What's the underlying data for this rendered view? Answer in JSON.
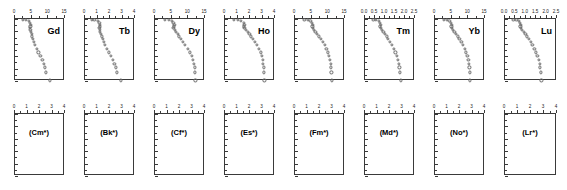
{
  "figure": {
    "type": "multi-panel-depth-profile-grid",
    "rows": 2,
    "columns": 8,
    "marker_style": "open-circle",
    "marker_color": "#6a6a6a",
    "axis_color": "#3a3a3a",
    "background": "#ffffff",
    "y_axis": {
      "label_values": [
        "0",
        "1",
        "2",
        "3",
        "4",
        "5"
      ],
      "min": 0,
      "max": 5,
      "direction": "increasing-downward"
    }
  },
  "chart_data": {
    "type": "scatter",
    "title": "",
    "xlabel": "",
    "ylabel": "",
    "shared_ylim": [
      0,
      5
    ],
    "shared_yticks": [
      0,
      1,
      2,
      3,
      4,
      5
    ],
    "grid": false,
    "legend": "none",
    "panels": [
      {
        "row": "top",
        "index": 0,
        "label": "Gd",
        "xlim": [
          0,
          15
        ],
        "xticks": [
          0,
          5,
          10,
          15
        ],
        "xticklabels": [
          "0",
          "5",
          "10",
          "15"
        ],
        "x": [
          2.4,
          3.2,
          4.1,
          4.5,
          4.7,
          4.6,
          4.5,
          4.6,
          4.8,
          5.0,
          5.1,
          5.3,
          5.6,
          6.0,
          6.5,
          7.0,
          7.6,
          8.2,
          8.6,
          9.0,
          9.2,
          10.5
        ],
        "y": [
          0.05,
          0.1,
          0.15,
          0.3,
          0.45,
          0.6,
          0.75,
          0.9,
          1.05,
          1.2,
          1.4,
          1.6,
          1.85,
          2.1,
          2.4,
          2.7,
          3.0,
          3.3,
          3.6,
          3.9,
          4.3,
          4.95
        ]
      },
      {
        "row": "top",
        "index": 1,
        "label": "Tb",
        "xlim": [
          0,
          4
        ],
        "xticks": [
          0,
          1,
          2,
          3,
          4
        ],
        "xticklabels": [
          "0",
          "1",
          "2",
          "3",
          "4"
        ],
        "x": [
          0.55,
          0.75,
          1.0,
          1.15,
          1.2,
          1.18,
          1.15,
          1.18,
          1.22,
          1.28,
          1.33,
          1.4,
          1.5,
          1.6,
          1.75,
          1.9,
          2.05,
          2.2,
          2.35,
          2.45,
          2.55,
          2.9
        ],
        "y": [
          0.05,
          0.1,
          0.15,
          0.3,
          0.45,
          0.6,
          0.75,
          0.9,
          1.05,
          1.2,
          1.4,
          1.6,
          1.85,
          2.1,
          2.4,
          2.7,
          3.0,
          3.3,
          3.6,
          3.9,
          4.3,
          4.95
        ]
      },
      {
        "row": "top",
        "index": 2,
        "label": "Dy",
        "xlim": [
          0,
          15
        ],
        "xticks": [
          0,
          5,
          10,
          15
        ],
        "xticklabels": [
          "0",
          "5",
          "10",
          "15"
        ],
        "x": [
          3.0,
          4.2,
          5.0,
          5.5,
          5.8,
          5.6,
          5.5,
          5.9,
          6.3,
          6.8,
          7.2,
          7.7,
          8.4,
          9.0,
          9.8,
          10.4,
          11.0,
          11.4,
          11.7,
          11.9,
          12.0,
          12.1
        ],
        "y": [
          0.05,
          0.1,
          0.15,
          0.3,
          0.45,
          0.6,
          0.75,
          0.9,
          1.05,
          1.2,
          1.4,
          1.6,
          1.85,
          2.1,
          2.4,
          2.7,
          3.0,
          3.3,
          3.6,
          3.9,
          4.3,
          4.95
        ]
      },
      {
        "row": "top",
        "index": 3,
        "label": "Ho",
        "xlim": [
          0,
          4
        ],
        "xticks": [
          0,
          1,
          2,
          3,
          4
        ],
        "xticklabels": [
          "0",
          "1",
          "2",
          "3",
          "4"
        ],
        "x": [
          0.7,
          1.0,
          1.3,
          1.5,
          1.55,
          1.5,
          1.55,
          1.65,
          1.8,
          1.95,
          2.1,
          2.25,
          2.4,
          2.55,
          2.7,
          2.85,
          2.95,
          3.0,
          3.05,
          3.1,
          3.1,
          3.15
        ],
        "y": [
          0.05,
          0.1,
          0.15,
          0.3,
          0.45,
          0.6,
          0.75,
          0.9,
          1.05,
          1.2,
          1.4,
          1.6,
          1.85,
          2.1,
          2.4,
          2.7,
          3.0,
          3.3,
          3.6,
          3.9,
          4.3,
          4.95
        ]
      },
      {
        "row": "top",
        "index": 4,
        "label": "",
        "xlim": [
          0,
          15
        ],
        "xticks": [
          0,
          5,
          10,
          15
        ],
        "xticklabels": [
          "0",
          "5",
          "10",
          "15"
        ],
        "x": [
          2.8,
          3.9,
          4.6,
          5.1,
          5.3,
          5.2,
          5.3,
          5.6,
          6.1,
          6.6,
          7.1,
          7.7,
          8.3,
          8.9,
          9.4,
          9.9,
          10.2,
          10.5,
          10.7,
          10.8,
          10.9,
          11.0
        ],
        "y": [
          0.05,
          0.1,
          0.15,
          0.3,
          0.45,
          0.6,
          0.75,
          0.9,
          1.05,
          1.2,
          1.4,
          1.6,
          1.85,
          2.1,
          2.4,
          2.7,
          3.0,
          3.3,
          3.6,
          3.9,
          4.3,
          4.95
        ]
      },
      {
        "row": "top",
        "index": 5,
        "label": "Tm",
        "xlim": [
          0,
          2.5
        ],
        "xticks": [
          0,
          0.5,
          1.0,
          1.5,
          2.0,
          2.5
        ],
        "xticklabels": [
          "0.0",
          "0.5",
          "1.0",
          "1.5",
          "2.0",
          "2.5"
        ],
        "x": [
          0.42,
          0.55,
          0.68,
          0.75,
          0.78,
          0.76,
          0.78,
          0.84,
          0.92,
          1.0,
          1.08,
          1.16,
          1.26,
          1.35,
          1.45,
          1.52,
          1.6,
          1.65,
          1.7,
          1.72,
          1.75,
          1.78
        ],
        "y": [
          0.05,
          0.1,
          0.15,
          0.3,
          0.45,
          0.6,
          0.75,
          0.9,
          1.05,
          1.2,
          1.4,
          1.6,
          1.85,
          2.1,
          2.4,
          2.7,
          3.0,
          3.3,
          3.6,
          3.9,
          4.3,
          4.95
        ]
      },
      {
        "row": "top",
        "index": 6,
        "label": "Yb",
        "xlim": [
          0,
          15
        ],
        "xticks": [
          0,
          5,
          10,
          15
        ],
        "xticklabels": [
          "0",
          "5",
          "10",
          "15"
        ],
        "x": [
          2.6,
          3.6,
          4.3,
          4.8,
          5.0,
          4.9,
          5.0,
          5.3,
          5.8,
          6.3,
          6.8,
          7.3,
          7.9,
          8.4,
          8.9,
          9.3,
          9.7,
          10.0,
          10.2,
          10.3,
          10.4,
          10.5
        ],
        "y": [
          0.05,
          0.1,
          0.15,
          0.3,
          0.45,
          0.6,
          0.75,
          0.9,
          1.05,
          1.2,
          1.4,
          1.6,
          1.85,
          2.1,
          2.4,
          2.7,
          3.0,
          3.3,
          3.6,
          3.9,
          4.3,
          4.95
        ]
      },
      {
        "row": "top",
        "index": 7,
        "label": "Lu",
        "xlim": [
          0,
          2.5
        ],
        "xticks": [
          0,
          0.5,
          1.0,
          1.5,
          2.0,
          2.5
        ],
        "xticklabels": [
          "0.0",
          "0.5",
          "1.0",
          "1.5",
          "2.0",
          "2.5"
        ],
        "x": [
          0.4,
          0.55,
          0.66,
          0.73,
          0.76,
          0.74,
          0.76,
          0.82,
          0.9,
          0.98,
          1.06,
          1.14,
          1.23,
          1.32,
          1.41,
          1.49,
          1.56,
          1.62,
          1.66,
          1.69,
          1.72,
          1.75
        ],
        "y": [
          0.05,
          0.1,
          0.15,
          0.3,
          0.45,
          0.6,
          0.75,
          0.9,
          1.05,
          1.2,
          1.4,
          1.6,
          1.85,
          2.1,
          2.4,
          2.7,
          3.0,
          3.3,
          3.6,
          3.9,
          4.3,
          4.95
        ]
      },
      {
        "row": "bottom",
        "index": 0,
        "label": "(Cm*)",
        "xlim": [
          0,
          4
        ],
        "xticks": [
          0,
          1,
          2,
          3,
          4
        ],
        "xticklabels": [
          "0",
          "1",
          "2",
          "3",
          "4"
        ],
        "x": [],
        "y": []
      },
      {
        "row": "bottom",
        "index": 1,
        "label": "(Bk*)",
        "xlim": [
          0,
          4
        ],
        "xticks": [
          0,
          1,
          2,
          3,
          4
        ],
        "xticklabels": [
          "0",
          "1",
          "2",
          "3",
          "4"
        ],
        "x": [],
        "y": []
      },
      {
        "row": "bottom",
        "index": 2,
        "label": "(Cf*)",
        "xlim": [
          0,
          4
        ],
        "xticks": [
          0,
          1,
          2,
          3,
          4
        ],
        "xticklabels": [
          "0",
          "1",
          "2",
          "3",
          "4"
        ],
        "x": [],
        "y": []
      },
      {
        "row": "bottom",
        "index": 3,
        "label": "(Es*)",
        "xlim": [
          0,
          4
        ],
        "xticks": [
          0,
          1,
          2,
          3,
          4
        ],
        "xticklabels": [
          "0",
          "1",
          "2",
          "3",
          "4"
        ],
        "x": [],
        "y": []
      },
      {
        "row": "bottom",
        "index": 4,
        "label": "(Fm*)",
        "xlim": [
          0,
          4
        ],
        "xticks": [
          0,
          1,
          2,
          3,
          4
        ],
        "xticklabels": [
          "0",
          "1",
          "2",
          "3",
          "4"
        ],
        "x": [],
        "y": []
      },
      {
        "row": "bottom",
        "index": 5,
        "label": "(Md*)",
        "xlim": [
          0,
          4
        ],
        "xticks": [
          0,
          1,
          2,
          3,
          4
        ],
        "xticklabels": [
          "0",
          "1",
          "2",
          "3",
          "4"
        ],
        "x": [],
        "y": []
      },
      {
        "row": "bottom",
        "index": 6,
        "label": "(No*)",
        "xlim": [
          0,
          4
        ],
        "xticks": [
          0,
          1,
          2,
          3,
          4
        ],
        "xticklabels": [
          "0",
          "1",
          "2",
          "3",
          "4"
        ],
        "x": [],
        "y": []
      },
      {
        "row": "bottom",
        "index": 7,
        "label": "(Lr*)",
        "xlim": [
          0,
          4
        ],
        "xticks": [
          0,
          1,
          2,
          3,
          4
        ],
        "xticklabels": [
          "0",
          "1",
          "2",
          "3",
          "4"
        ],
        "x": [],
        "y": []
      }
    ]
  }
}
